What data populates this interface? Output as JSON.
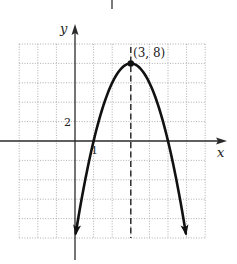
{
  "chart_data": {
    "type": "line",
    "title": "",
    "function": "y = -2(x - 3)^2 + 8",
    "xlabel": "x",
    "ylabel": "y",
    "xlim": [
      -3,
      7
    ],
    "ylim": [
      -10,
      10
    ],
    "x_grid_step": 1,
    "y_grid_step": 2,
    "grid": true,
    "grid_style": "dotted",
    "tick_labels": {
      "x": [
        {
          "value": 1,
          "label": "1"
        }
      ],
      "y": [
        {
          "value": 2,
          "label": "2"
        }
      ]
    },
    "series": [
      {
        "name": "parabola",
        "x": [
          0.04,
          0.5,
          1,
          1.5,
          2,
          2.5,
          3,
          3.5,
          4,
          4.5,
          5,
          5.5,
          5.96
        ],
        "y": [
          -9.52,
          -4.5,
          0,
          3.5,
          6,
          7.5,
          8,
          7.5,
          6,
          3.5,
          0,
          -4.5,
          -9.52
        ],
        "arrows_at_ends": true
      }
    ],
    "annotations": [
      {
        "type": "point",
        "x": 3,
        "y": 8,
        "label": "(3, 8)"
      },
      {
        "type": "dashed-vertical-line",
        "x": 3,
        "label": "axis of symmetry"
      }
    ],
    "legend": null
  },
  "labels": {
    "y_axis": "y",
    "x_axis": "x",
    "vertex": "(3, 8)",
    "x_tick": "1",
    "y_tick": "2"
  },
  "colors": {
    "axis": "#2a2a2a",
    "curve": "#111111",
    "grid": "#9a9a9a",
    "background": "#ffffff"
  }
}
